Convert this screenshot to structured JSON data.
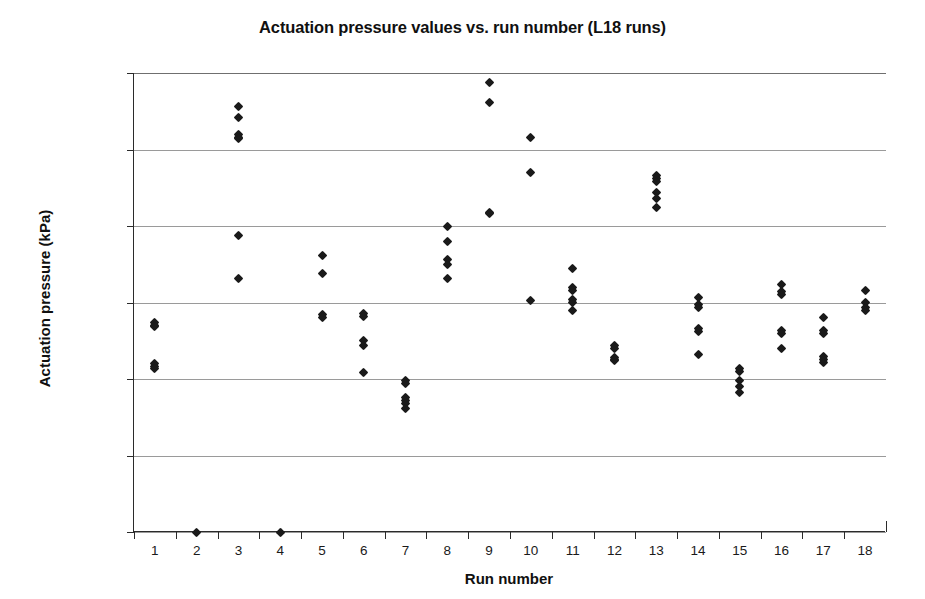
{
  "chart_data": {
    "type": "scatter",
    "title": "Actuation pressure values vs. run number (L18 runs)",
    "xlabel": "Run number",
    "ylabel": "Actuation pressure (kPa)",
    "xlim": [
      0.5,
      18.5
    ],
    "ylim": [
      0,
      300
    ],
    "grid": true,
    "legend": "none",
    "marker": "diamond",
    "marker_color": "#1a1a1a",
    "ytick_labels": [
      "0.00",
      "50.00",
      "100.00",
      "150.00",
      "200.00",
      "250.00",
      "300.00"
    ],
    "ytick_values": [
      0,
      50,
      100,
      150,
      200,
      250,
      300
    ],
    "xtick_labels": [
      "1",
      "2",
      "3",
      "4",
      "5",
      "6",
      "7",
      "8",
      "9",
      "10",
      "11",
      "12",
      "13",
      "14",
      "15",
      "16",
      "17",
      "18"
    ],
    "xtick_values": [
      1,
      2,
      3,
      4,
      5,
      6,
      7,
      8,
      9,
      10,
      11,
      12,
      13,
      14,
      15,
      16,
      17,
      18
    ],
    "categories": [
      "1",
      "2",
      "3",
      "4",
      "5",
      "6",
      "7",
      "8",
      "9",
      "10",
      "11",
      "12",
      "13",
      "14",
      "15",
      "16",
      "17",
      "18"
    ],
    "groups": [
      {
        "run": 1,
        "values": [
          137,
          135,
          134,
          110,
          108,
          107
        ]
      },
      {
        "run": 2,
        "values": [
          0
        ]
      },
      {
        "run": 3,
        "values": [
          278,
          271,
          260,
          258,
          257,
          194,
          166
        ]
      },
      {
        "run": 4,
        "values": [
          0
        ]
      },
      {
        "run": 5,
        "values": [
          181,
          169,
          142,
          140
        ]
      },
      {
        "run": 6,
        "values": [
          143,
          141,
          125,
          122,
          104
        ]
      },
      {
        "run": 7,
        "values": [
          99,
          97,
          88,
          86,
          84,
          81
        ]
      },
      {
        "run": 8,
        "values": [
          200,
          190,
          178,
          175,
          166
        ]
      },
      {
        "run": 9,
        "values": [
          294,
          281,
          209,
          208
        ]
      },
      {
        "run": 10,
        "values": [
          258,
          235,
          151
        ]
      },
      {
        "run": 11,
        "values": [
          172,
          160,
          158,
          152,
          150,
          145
        ]
      },
      {
        "run": 12,
        "values": [
          122,
          120,
          114,
          113,
          112
        ]
      },
      {
        "run": 13,
        "values": [
          233,
          231,
          229,
          222,
          218,
          212
        ]
      },
      {
        "run": 14,
        "values": [
          153,
          149,
          147,
          133,
          131,
          116
        ]
      },
      {
        "run": 15,
        "values": [
          107,
          105,
          99,
          95,
          91
        ]
      },
      {
        "run": 16,
        "values": [
          162,
          157,
          155,
          132,
          130,
          120
        ]
      },
      {
        "run": 17,
        "values": [
          140,
          132,
          130,
          115,
          113,
          111
        ]
      },
      {
        "run": 18,
        "values": [
          158,
          150,
          147,
          145
        ]
      }
    ]
  }
}
